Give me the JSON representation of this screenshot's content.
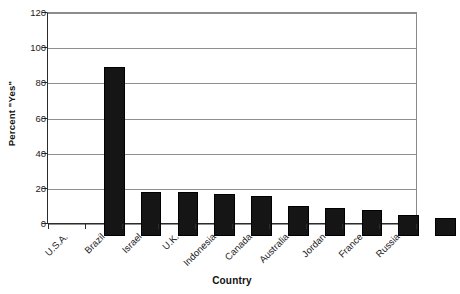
{
  "chart_data": {
    "type": "bar",
    "title": "",
    "subtitle": "",
    "xlabel": "Country",
    "ylabel": "Percent \"Yes\"",
    "categories": [
      "U.S.A.",
      "Brazil",
      "Israel",
      "U.K.",
      "Indonesia",
      "Canada",
      "Australia",
      "Jordan",
      "France",
      "Russia"
    ],
    "values": [
      96,
      25,
      25,
      24,
      23,
      17,
      16,
      15,
      12,
      10
    ],
    "series": [
      {
        "name": "Percent \"Yes\"",
        "values": [
          96,
          25,
          25,
          24,
          23,
          17,
          16,
          15,
          12,
          10
        ]
      }
    ],
    "ylim": [
      0,
      120
    ],
    "yticks": [
      0,
      20,
      40,
      60,
      80,
      100,
      120
    ],
    "ytick_labels": [
      "0",
      "20",
      "40",
      "60",
      "80",
      "100",
      "120"
    ],
    "xlim_categories": 10,
    "grid": {
      "horizontal": true,
      "vertical": false,
      "color": "#8f8f8f"
    },
    "legend": {
      "visible": false,
      "position": "none",
      "entries": []
    },
    "bar_color": "#151515",
    "bar_edge_color": "#000000",
    "background_color": "#ffffff",
    "axis_color": "#2b2b2b",
    "xtick_label_rotation": -45,
    "ylabel_rotation": -90,
    "annotations": []
  }
}
